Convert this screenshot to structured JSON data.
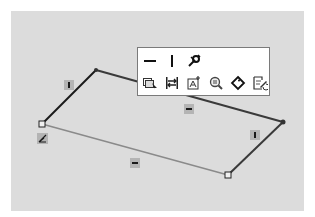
{
  "canvas": {
    "background": "#dcdcdc"
  },
  "sketch": {
    "vertices": [
      {
        "name": "top-left",
        "x": 96,
        "y": 70,
        "style": "point"
      },
      {
        "name": "top-right",
        "x": 283,
        "y": 122,
        "style": "point"
      },
      {
        "name": "bottom-right",
        "x": 228,
        "y": 175,
        "style": "square"
      },
      {
        "name": "left",
        "x": 42,
        "y": 124,
        "style": "square"
      }
    ],
    "edges": [
      {
        "from": "left",
        "to": "top-left",
        "color": "#1a1a1a",
        "relation": "vertical"
      },
      {
        "from": "top-left",
        "to": "top-right",
        "color": "#3a3a3a",
        "relation": "horizontal"
      },
      {
        "from": "top-right",
        "to": "bottom-right",
        "color": "#3a3a3a",
        "relation": "vertical"
      },
      {
        "from": "bottom-right",
        "to": "left",
        "color": "#8a8a8a",
        "relation": "horizontal"
      }
    ],
    "relation_badges": [
      {
        "type": "vertical",
        "x": 62,
        "y": 78
      },
      {
        "type": "horizontal",
        "x": 184,
        "y": 106
      },
      {
        "type": "vertical",
        "x": 250,
        "y": 131
      },
      {
        "type": "horizontal",
        "x": 130,
        "y": 156
      }
    ],
    "coincident_badge": {
      "x": 37,
      "y": 131
    }
  },
  "toolbar": {
    "row1": [
      {
        "name": "horizontal-relation",
        "icon": "horizontal-icon"
      },
      {
        "name": "vertical-relation",
        "icon": "vertical-icon"
      },
      {
        "name": "fix-relation",
        "icon": "fix-icon"
      }
    ],
    "row2": [
      {
        "name": "select-other",
        "icon": "select-other-icon"
      },
      {
        "name": "smart-dimension",
        "icon": "dimension-icon"
      },
      {
        "name": "add-relation",
        "icon": "add-relation-icon"
      },
      {
        "name": "zoom-selection",
        "icon": "zoom-icon"
      },
      {
        "name": "tag",
        "icon": "tag-icon"
      },
      {
        "name": "edit-sketch",
        "icon": "edit-sketch-icon"
      }
    ]
  }
}
